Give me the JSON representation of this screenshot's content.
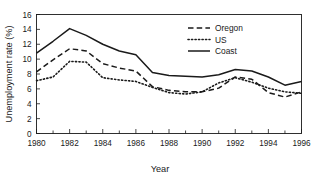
{
  "chart_data": {
    "type": "line",
    "title": "",
    "xlabel": "Year",
    "ylabel": "Unemployment rate (%)",
    "xlim": [
      1980,
      1996
    ],
    "ylim": [
      0,
      16
    ],
    "xticks": [
      1980,
      1982,
      1984,
      1986,
      1988,
      1990,
      1992,
      1994,
      1996
    ],
    "xticklabels": [
      "1980",
      "1982",
      "1984",
      "1986",
      "1988",
      "1990",
      "1992",
      "1994",
      "1996"
    ],
    "xminorticks": [
      1981,
      1983,
      1985,
      1987,
      1989,
      1991,
      1993,
      1995
    ],
    "yticks": [
      0,
      2,
      4,
      6,
      8,
      10,
      12,
      14,
      16
    ],
    "yticklabels": [
      "0",
      "2",
      "4",
      "6",
      "8",
      "10",
      "12",
      "14",
      "16"
    ],
    "grid": false,
    "legend_position": "top-center-right",
    "frame": "box",
    "x": [
      1980,
      1981,
      1982,
      1983,
      1984,
      1985,
      1986,
      1987,
      1988,
      1989,
      1990,
      1991,
      1992,
      1993,
      1994,
      1995,
      1996
    ],
    "series": [
      {
        "name": "Oregon",
        "style": "dashed",
        "color": "#1a1a1a",
        "values": [
          8.3,
          9.9,
          11.4,
          11.1,
          9.4,
          8.8,
          8.4,
          6.3,
          5.8,
          5.6,
          5.6,
          6.1,
          7.6,
          7.3,
          5.5,
          4.9,
          5.6
        ]
      },
      {
        "name": "US",
        "style": "dotted",
        "color": "#1a1a1a",
        "values": [
          7.1,
          7.6,
          9.7,
          9.6,
          7.5,
          7.2,
          7.0,
          6.2,
          5.5,
          5.3,
          5.6,
          6.8,
          7.5,
          6.9,
          6.1,
          5.6,
          5.4
        ]
      },
      {
        "name": "Coast",
        "style": "solid",
        "color": "#1a1a1a",
        "values": [
          10.8,
          12.4,
          14.1,
          13.2,
          12.0,
          11.1,
          10.6,
          8.2,
          7.8,
          7.7,
          7.6,
          7.9,
          8.6,
          8.4,
          7.6,
          6.5,
          7.0
        ]
      }
    ]
  },
  "legend": {
    "items": [
      {
        "label": "Oregon",
        "style": "dashed"
      },
      {
        "label": "US",
        "style": "dotted"
      },
      {
        "label": "Coast",
        "style": "solid"
      }
    ]
  }
}
